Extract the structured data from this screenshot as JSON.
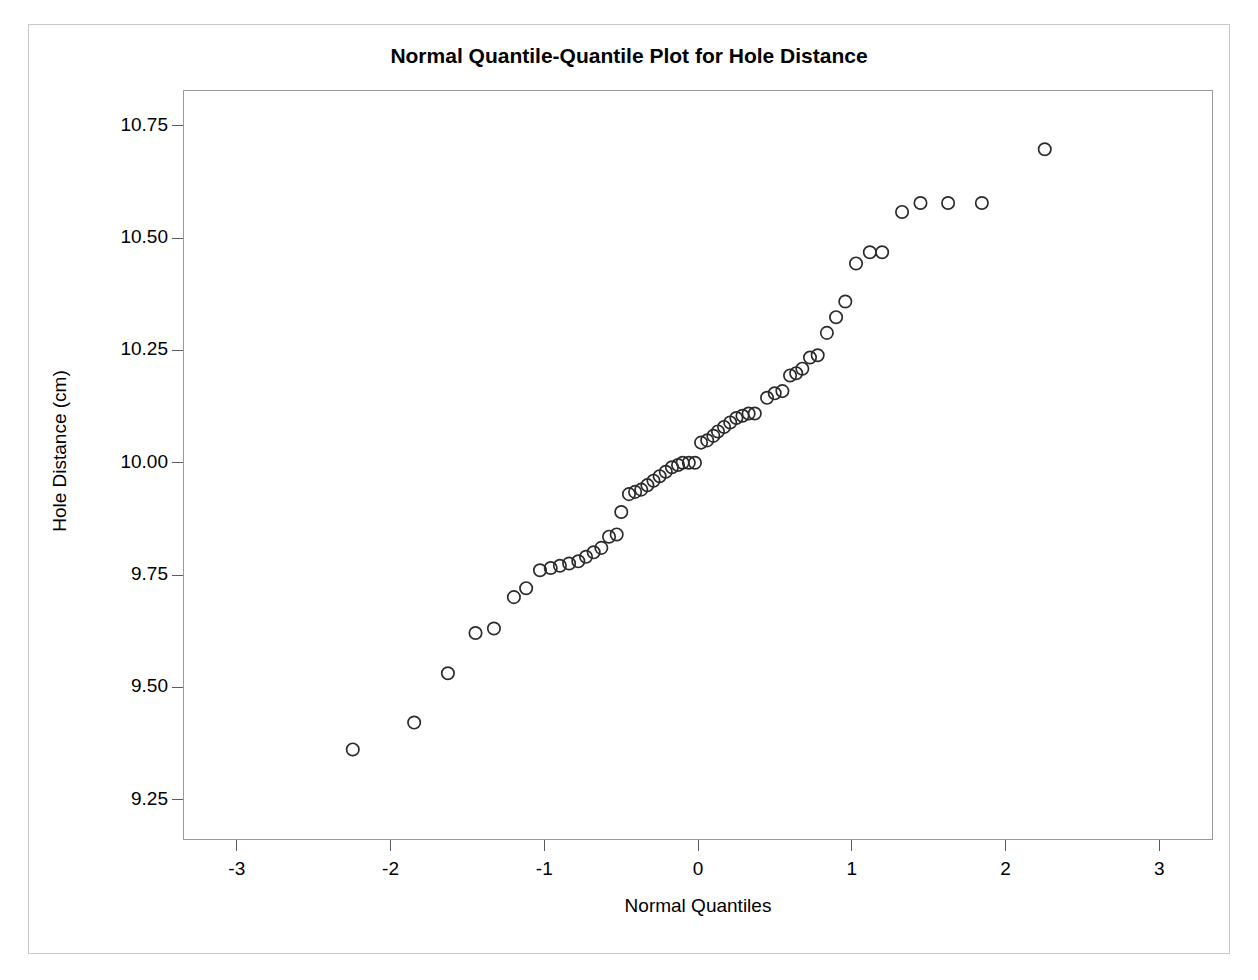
{
  "chart_data": {
    "type": "scatter",
    "title": "Normal Quantile-Quantile Plot for Hole Distance",
    "xlabel": "Normal Quantiles",
    "ylabel": "Hole Distance (cm)",
    "xlim": [
      -3.35,
      3.35
    ],
    "ylim": [
      9.16,
      10.83
    ],
    "xticks": [
      -3,
      -2,
      -1,
      0,
      1,
      2,
      3
    ],
    "xtick_labels": [
      "-3",
      "-2",
      "-1",
      "0",
      "1",
      "2",
      "3"
    ],
    "yticks": [
      9.25,
      9.5,
      9.75,
      10.0,
      10.25,
      10.5,
      10.75
    ],
    "ytick_labels": [
      "9.25",
      "9.50",
      "9.75",
      "10.00",
      "10.25",
      "10.50",
      "10.75"
    ],
    "grid": false,
    "legend": false,
    "marker": "open-circle",
    "marker_color": "#2b2b2b",
    "series": [
      {
        "name": "Hole Distance",
        "x": [
          -2.25,
          -1.85,
          -1.63,
          -1.45,
          -1.33,
          -1.2,
          -1.12,
          -1.03,
          -0.96,
          -0.9,
          -0.84,
          -0.78,
          -0.73,
          -0.68,
          -0.63,
          -0.58,
          -0.53,
          -0.5,
          -0.45,
          -0.41,
          -0.37,
          -0.33,
          -0.29,
          -0.25,
          -0.21,
          -0.17,
          -0.13,
          -0.1,
          -0.06,
          -0.02,
          0.02,
          0.06,
          0.1,
          0.13,
          0.17,
          0.21,
          0.25,
          0.29,
          0.33,
          0.37,
          0.45,
          0.5,
          0.55,
          0.6,
          0.64,
          0.68,
          0.73,
          0.78,
          0.84,
          0.9,
          0.96,
          1.03,
          1.12,
          1.2,
          1.33,
          1.45,
          1.63,
          1.85,
          2.26
        ],
        "y": [
          9.36,
          9.42,
          9.53,
          9.62,
          9.63,
          9.7,
          9.72,
          9.76,
          9.765,
          9.77,
          9.775,
          9.78,
          9.79,
          9.8,
          9.81,
          9.835,
          9.84,
          9.89,
          9.93,
          9.935,
          9.94,
          9.95,
          9.96,
          9.97,
          9.98,
          9.99,
          9.995,
          10.0,
          10.0,
          10.0,
          10.045,
          10.05,
          10.06,
          10.07,
          10.08,
          10.09,
          10.1,
          10.105,
          10.11,
          10.11,
          10.145,
          10.155,
          10.16,
          10.195,
          10.2,
          10.21,
          10.235,
          10.24,
          10.29,
          10.325,
          10.36,
          10.445,
          10.47,
          10.47,
          10.56,
          10.58,
          10.58,
          10.58,
          10.7
        ]
      }
    ]
  }
}
